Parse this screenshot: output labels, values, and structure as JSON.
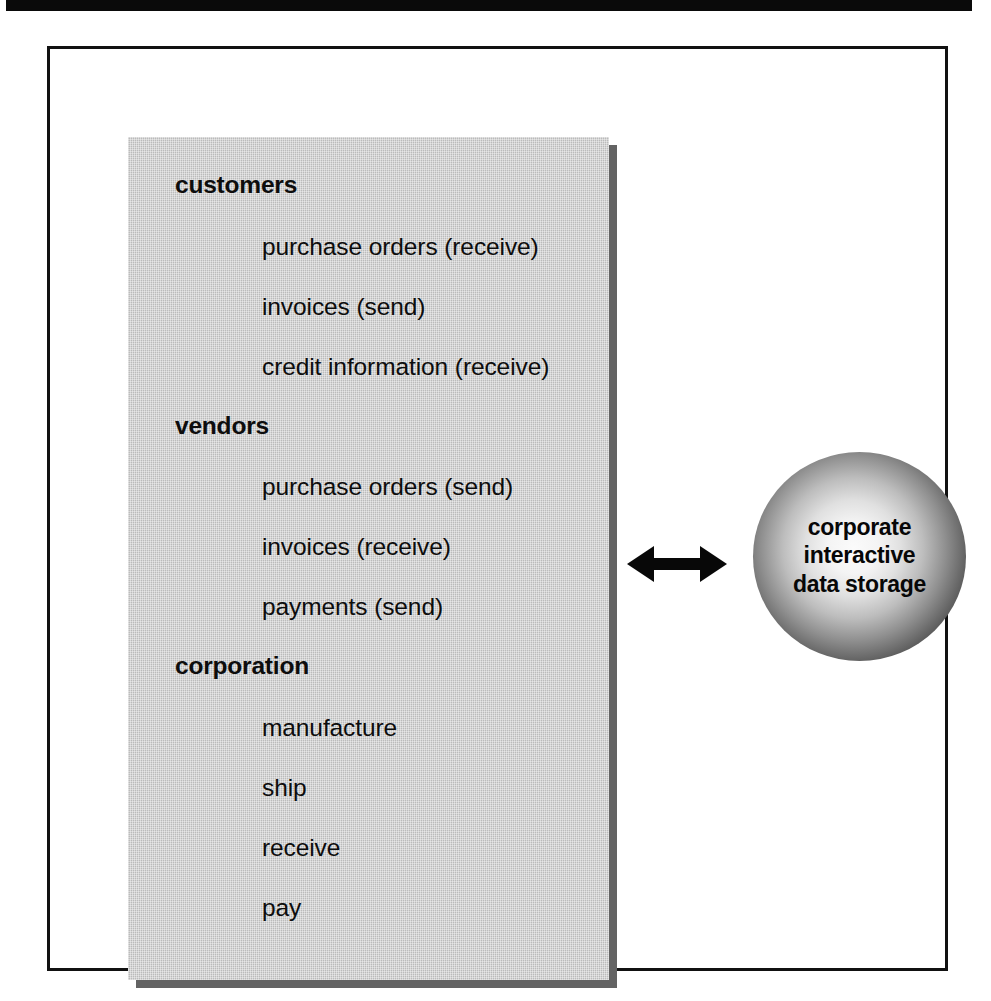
{
  "figure": {
    "panel": {
      "groups": [
        {
          "heading": "customers",
          "items": [
            "purchase orders (receive)",
            "invoices (send)",
            "credit information (receive)"
          ]
        },
        {
          "heading": "vendors",
          "items": [
            "purchase orders (send)",
            "invoices (receive)",
            "payments (send)"
          ]
        },
        {
          "heading": "corporation",
          "items": [
            "manufacture",
            "ship",
            "receive",
            "pay"
          ]
        }
      ]
    },
    "connector": {
      "icon": "double-headed-horizontal-arrow"
    },
    "sphere": {
      "lines": [
        "corporate",
        "interactive",
        "data storage"
      ]
    },
    "colors": {
      "panel_gray": "#c6c6c6",
      "panel_shadow": "#636363",
      "frame_border": "#111111",
      "text": "#0d0d0d",
      "sphere_center": "#fbfbfb",
      "sphere_edge": "#050505",
      "scan_band": "#0a0a0a"
    }
  }
}
